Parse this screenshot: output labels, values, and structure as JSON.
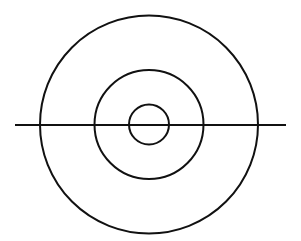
{
  "diagram": {
    "background": "#ffffff",
    "stroke_color": "#111111",
    "stroke_width": 2,
    "center": {
      "x": 149,
      "y": 124.5
    },
    "circles": [
      {
        "name": "outer-circle",
        "r": 109
      },
      {
        "name": "middle-circle",
        "r": 54.5
      },
      {
        "name": "inner-circle",
        "r": 20
      }
    ],
    "line": {
      "name": "horizontal-line",
      "x1": 15,
      "x2": 286,
      "y": 125
    }
  }
}
